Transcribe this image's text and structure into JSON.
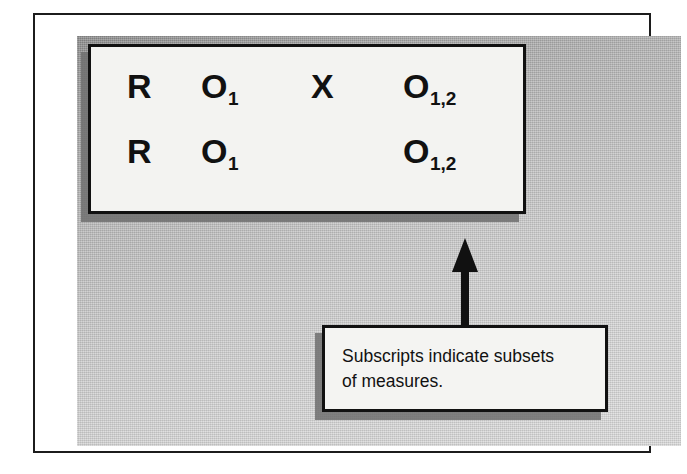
{
  "figure": {
    "background_color": "#d5d5d5",
    "frame_color": "#1c1c1c",
    "box_fill_color": "#f3f3f1",
    "shadow_color": "#6e6e6e",
    "text_color": "#111111"
  },
  "notation": {
    "rows": [
      {
        "cells": [
          {
            "symbol": "R",
            "subscript": ""
          },
          {
            "symbol": "O",
            "subscript": "1"
          },
          {
            "symbol": "X",
            "subscript": ""
          },
          {
            "symbol": "O",
            "subscript": "1,2"
          }
        ]
      },
      {
        "cells": [
          {
            "symbol": "R",
            "subscript": ""
          },
          {
            "symbol": "O",
            "subscript": "1"
          },
          {
            "symbol": "",
            "subscript": ""
          },
          {
            "symbol": "O",
            "subscript": "1,2"
          }
        ]
      }
    ]
  },
  "annotation": {
    "arrow": "up-arrow-icon",
    "caption_line_1": "Subscripts indicate subsets",
    "caption_line_2": "of measures."
  }
}
